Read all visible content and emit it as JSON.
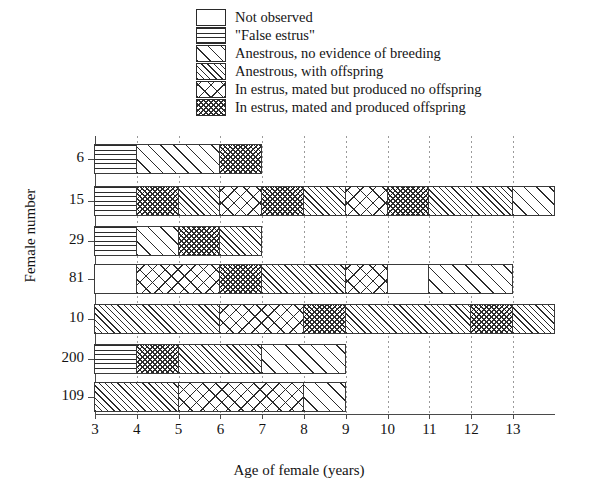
{
  "chart_data": {
    "type": "bar",
    "orientation": "horizontal-stacked-timeline",
    "title": "",
    "xlabel": "Age of female (years)",
    "ylabel": "Female number",
    "xlim": [
      3,
      14
    ],
    "xticks": [
      3,
      4,
      5,
      6,
      7,
      8,
      9,
      10,
      11,
      12,
      13
    ],
    "xticklabels": [
      "3",
      "4",
      "5",
      "6",
      "7",
      "8",
      "9",
      "10",
      "11",
      "12",
      "13"
    ],
    "grid": "vertical dotted at each x tick",
    "legend_position": "top",
    "categories": [
      "6",
      "15",
      "29",
      "81",
      "10",
      "200",
      "109"
    ],
    "legend": [
      {
        "key": "not-observed",
        "label": "Not observed",
        "pattern": "p-none"
      },
      {
        "key": "false-estrus",
        "label": "\"False estrus\"",
        "pattern": "p-horiz"
      },
      {
        "key": "anestrous-no-breeding",
        "label": "Anestrous, no evidence of breeding",
        "pattern": "p-diag"
      },
      {
        "key": "anestrous-offspring",
        "label": "Anestrous, with offspring",
        "pattern": "p-diag2"
      },
      {
        "key": "estrus-no-offspring",
        "label": "In estrus, mated but produced no offspring",
        "pattern": "p-cross"
      },
      {
        "key": "estrus-offspring",
        "label": "In estrus, mated and produced offspring",
        "pattern": "p-cross2"
      }
    ],
    "rows": [
      {
        "female": "6",
        "segments": [
          {
            "start": 3,
            "end": 4,
            "key": "false-estrus"
          },
          {
            "start": 4,
            "end": 6,
            "key": "anestrous-no-breeding"
          },
          {
            "start": 6,
            "end": 7,
            "key": "estrus-offspring"
          }
        ]
      },
      {
        "female": "15",
        "segments": [
          {
            "start": 3,
            "end": 4,
            "key": "false-estrus"
          },
          {
            "start": 4,
            "end": 5,
            "key": "estrus-offspring"
          },
          {
            "start": 5,
            "end": 6,
            "key": "anestrous-offspring"
          },
          {
            "start": 6,
            "end": 7,
            "key": "estrus-no-offspring"
          },
          {
            "start": 7,
            "end": 8,
            "key": "estrus-offspring"
          },
          {
            "start": 8,
            "end": 9,
            "key": "anestrous-offspring"
          },
          {
            "start": 9,
            "end": 10,
            "key": "estrus-no-offspring"
          },
          {
            "start": 10,
            "end": 11,
            "key": "estrus-offspring"
          },
          {
            "start": 11,
            "end": 13,
            "key": "anestrous-offspring"
          },
          {
            "start": 13,
            "end": 14,
            "key": "anestrous-no-breeding"
          }
        ]
      },
      {
        "female": "29",
        "segments": [
          {
            "start": 3,
            "end": 4,
            "key": "false-estrus"
          },
          {
            "start": 4,
            "end": 5,
            "key": "anestrous-no-breeding"
          },
          {
            "start": 5,
            "end": 6,
            "key": "estrus-offspring"
          },
          {
            "start": 6,
            "end": 7,
            "key": "anestrous-offspring"
          }
        ]
      },
      {
        "female": "81",
        "segments": [
          {
            "start": 3,
            "end": 4,
            "key": "not-observed"
          },
          {
            "start": 4,
            "end": 6,
            "key": "estrus-no-offspring"
          },
          {
            "start": 6,
            "end": 7,
            "key": "estrus-offspring"
          },
          {
            "start": 7,
            "end": 9,
            "key": "anestrous-offspring"
          },
          {
            "start": 9,
            "end": 10,
            "key": "estrus-no-offspring"
          },
          {
            "start": 10,
            "end": 11,
            "key": "not-observed"
          },
          {
            "start": 11,
            "end": 13,
            "key": "anestrous-no-breeding"
          }
        ]
      },
      {
        "female": "10",
        "segments": [
          {
            "start": 3,
            "end": 6,
            "key": "anestrous-offspring"
          },
          {
            "start": 6,
            "end": 8,
            "key": "estrus-no-offspring"
          },
          {
            "start": 8,
            "end": 9,
            "key": "estrus-offspring"
          },
          {
            "start": 9,
            "end": 12,
            "key": "anestrous-offspring"
          },
          {
            "start": 12,
            "end": 13,
            "key": "estrus-offspring"
          },
          {
            "start": 13,
            "end": 14,
            "key": "anestrous-offspring"
          }
        ]
      },
      {
        "female": "200",
        "segments": [
          {
            "start": 3,
            "end": 4,
            "key": "false-estrus"
          },
          {
            "start": 4,
            "end": 5,
            "key": "estrus-offspring"
          },
          {
            "start": 5,
            "end": 7,
            "key": "anestrous-offspring"
          },
          {
            "start": 7,
            "end": 9,
            "key": "anestrous-no-breeding"
          }
        ]
      },
      {
        "female": "109",
        "segments": [
          {
            "start": 3,
            "end": 5,
            "key": "anestrous-offspring"
          },
          {
            "start": 5,
            "end": 8,
            "key": "estrus-no-offspring"
          },
          {
            "start": 8,
            "end": 9,
            "key": "anestrous-no-breeding"
          }
        ]
      }
    ]
  }
}
